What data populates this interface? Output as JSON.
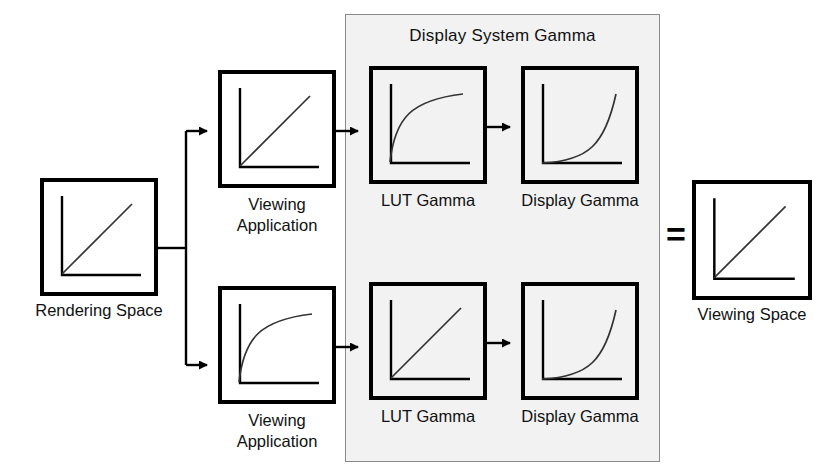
{
  "diagram": {
    "title_visible": false,
    "panel": {
      "label": "Display System Gamma",
      "bg_color": "#f2f2f2",
      "border_color": "#8a8a8a"
    },
    "equals_symbol": "=",
    "line_color": "#000000",
    "curve_color": "#333333",
    "nodes": [
      {
        "id": "rendering-space",
        "label": "Rendering Space",
        "curve": "linear",
        "x": 40,
        "y": 178,
        "w": 118,
        "h": 118,
        "label_x": 18,
        "label_y": 300,
        "label_w": 162
      },
      {
        "id": "viewing-application-top",
        "label": "Viewing\nApplication",
        "curve": "linear",
        "x": 218,
        "y": 70,
        "w": 118,
        "h": 118,
        "label_x": 198,
        "label_y": 194,
        "label_w": 158
      },
      {
        "id": "lut-gamma-top",
        "label": "LUT Gamma",
        "curve": "concave",
        "x": 369,
        "y": 66,
        "w": 118,
        "h": 118,
        "label_x": 349,
        "label_y": 190,
        "label_w": 158
      },
      {
        "id": "display-gamma-top",
        "label": "Display Gamma",
        "curve": "convex",
        "x": 521,
        "y": 66,
        "w": 118,
        "h": 118,
        "label_x": 498,
        "label_y": 190,
        "label_w": 164
      },
      {
        "id": "viewing-application-bottom",
        "label": "Viewing\nApplication",
        "curve": "concave",
        "x": 218,
        "y": 286,
        "w": 118,
        "h": 118,
        "label_x": 198,
        "label_y": 410,
        "label_w": 158
      },
      {
        "id": "lut-gamma-bottom",
        "label": "LUT Gamma",
        "curve": "linear",
        "x": 369,
        "y": 282,
        "w": 118,
        "h": 118,
        "label_x": 349,
        "label_y": 406,
        "label_w": 158
      },
      {
        "id": "display-gamma-bottom",
        "label": "Display Gamma",
        "curve": "convex",
        "x": 521,
        "y": 282,
        "w": 118,
        "h": 118,
        "label_x": 498,
        "label_y": 406,
        "label_w": 164
      },
      {
        "id": "viewing-space",
        "label": "Viewing Space",
        "curve": "linear",
        "x": 692,
        "y": 180,
        "w": 120,
        "h": 120,
        "label_x": 678,
        "label_y": 304,
        "label_w": 148
      }
    ],
    "curve_descriptions": {
      "linear": "identity / straight diagonal response",
      "concave": "gamma less than one, rises steeply then flattens",
      "convex": "gamma greater than one, flat then rises steeply"
    }
  }
}
